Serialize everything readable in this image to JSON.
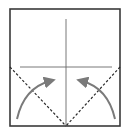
{
  "diagram": {
    "type": "origami-fold-step",
    "colors": {
      "border": "#3a3a3a",
      "crease": "#6a6a6a",
      "dashed": "#2a2a2a",
      "arrow": "#7a7a7a",
      "background": "#ffffff"
    },
    "elements": [
      "square-paper",
      "vertical-crease",
      "horizontal-crease",
      "left-dashed-fold-line",
      "right-dashed-fold-line",
      "left-fold-arrow",
      "right-fold-arrow"
    ]
  }
}
